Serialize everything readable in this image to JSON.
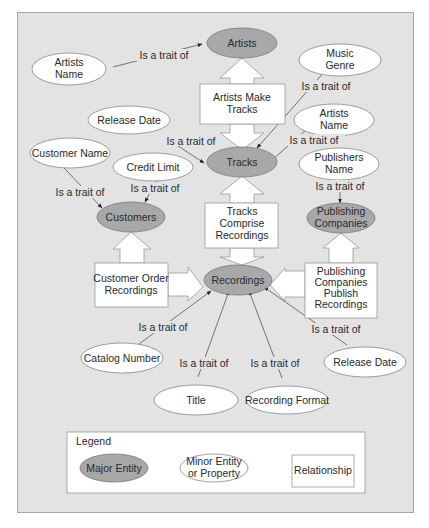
{
  "diagram": {
    "major_entities": {
      "artists": "Artists",
      "tracks": "Tracks",
      "customers": "Customers",
      "recordings": "Recordings",
      "publishing_companies": [
        "Publishing",
        "Companies"
      ]
    },
    "minor_entities": {
      "artists_name_1": [
        "Artists",
        "Name"
      ],
      "music_genre": [
        "Music",
        "Genre"
      ],
      "release_date_1": "Release Date",
      "artists_name_2": [
        "Artists",
        "Name"
      ],
      "customer_name": "Customer Name",
      "credit_limit": "Credit Limit",
      "publishers_name": [
        "Publishers",
        "Name"
      ],
      "catalog_number": "Catalog Number",
      "title": "Title",
      "recording_format": "Recording Format",
      "release_date_2": "Release Date"
    },
    "relationships": {
      "artists_make_tracks": [
        "Artists Make",
        "Tracks"
      ],
      "tracks_comprise_recordings": [
        "Tracks",
        "Comprise",
        "Recordings"
      ],
      "customer_order_recordings": [
        "Customer Order",
        "Recordings"
      ],
      "publishing_companies_publish_recordings": [
        "Publishing",
        "Companies",
        "Publish",
        "Recordings"
      ]
    },
    "edge_label": "Is a trait of"
  },
  "legend": {
    "title": "Legend",
    "major": "Major Entity",
    "minor": [
      "Minor Entity",
      "or Property"
    ],
    "relationship": "Relationship"
  }
}
